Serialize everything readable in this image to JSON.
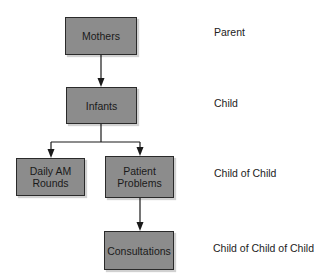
{
  "diagram": {
    "type": "hierarchy",
    "nodes": [
      {
        "id": "mothers",
        "label": "Mothers"
      },
      {
        "id": "infants",
        "label": "Infants"
      },
      {
        "id": "daily_am_rounds",
        "label": "Daily AM Rounds",
        "lines": [
          "Daily AM",
          "Rounds"
        ]
      },
      {
        "id": "patient_problems",
        "label": "Patient Problems",
        "lines": [
          "Patient",
          "Problems"
        ]
      },
      {
        "id": "consultations",
        "label": "Consultations"
      }
    ],
    "edges": [
      {
        "from": "mothers",
        "to": "infants"
      },
      {
        "from": "infants",
        "to": "daily_am_rounds"
      },
      {
        "from": "infants",
        "to": "patient_problems"
      },
      {
        "from": "patient_problems",
        "to": "consultations"
      }
    ],
    "levels": [
      {
        "label": "Parent"
      },
      {
        "label": "Child"
      },
      {
        "label": "Child of Child"
      },
      {
        "label": "Child of Child of Child"
      }
    ],
    "colors": {
      "box_fill": "#8c8c8c",
      "box_border": "#2a2a2a",
      "line": "#1a1a1a"
    }
  }
}
